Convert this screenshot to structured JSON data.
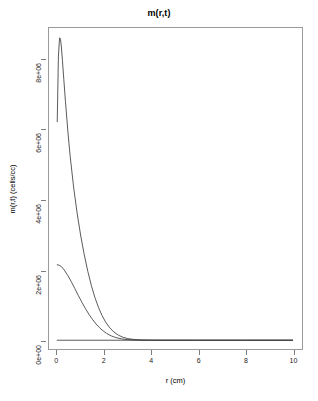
{
  "chart_data": {
    "type": "line",
    "title": "m(r,t)",
    "xlabel": "r (cm)",
    "ylabel": "m(r,t) (cells/cc)",
    "xlim": [
      -0.35,
      10.4
    ],
    "ylim": [
      -250000,
      8900000
    ],
    "grid": false,
    "legend": null,
    "x_ticks": [
      0,
      2,
      4,
      6,
      8,
      10
    ],
    "x_tick_labels": [
      "0",
      "2",
      "4",
      "6",
      "8",
      "10"
    ],
    "y_ticks": [
      0,
      2000000,
      4000000,
      6000000,
      8000000
    ],
    "y_tick_labels": [
      "0e+00",
      "2e+06",
      "4e+06",
      "6e+06",
      "8e+06"
    ],
    "line_color": "#3c3c3c",
    "axis_color": "#7d7d7d",
    "box_color": "#9a9a9a",
    "series": [
      {
        "name": "curve-peak-high",
        "color": "#3c3c3c",
        "x": [
          0.0,
          0.05,
          0.1,
          0.14,
          0.18,
          0.22,
          0.28,
          0.35,
          0.45,
          0.55,
          0.7,
          0.85,
          1.0,
          1.15,
          1.3,
          1.45,
          1.6,
          1.75,
          1.9,
          2.05,
          2.2,
          2.4,
          2.6,
          2.8,
          3.0,
          3.3,
          3.6,
          4.0,
          4.5,
          5.0,
          6.0,
          7.0,
          8.0,
          9.0,
          10.0
        ],
        "y": [
          6230000,
          8100000,
          8620000,
          8580000,
          8330000,
          7980000,
          7430000,
          6800000,
          5960000,
          5240000,
          4340000,
          3600000,
          2970000,
          2430000,
          1960000,
          1560000,
          1220000,
          940000,
          710000,
          525000,
          380000,
          238000,
          143000,
          83000,
          46000,
          18500,
          7000,
          1900,
          330,
          55,
          2,
          0,
          0,
          0,
          0
        ]
      },
      {
        "name": "curve-peak-low",
        "color": "#3c3c3c",
        "x": [
          0.0,
          0.08,
          0.18,
          0.3,
          0.45,
          0.6,
          0.75,
          0.9,
          1.05,
          1.2,
          1.35,
          1.5,
          1.65,
          1.8,
          1.95,
          2.1,
          2.3,
          2.5,
          2.75,
          3.0,
          3.3,
          3.6,
          4.0,
          4.5,
          5.0,
          6.0,
          7.0,
          8.0,
          9.0,
          10.0
        ],
        "y": [
          2150000,
          2140000,
          2095000,
          2000000,
          1845000,
          1665000,
          1470000,
          1270000,
          1080000,
          900000,
          735000,
          590000,
          462000,
          354000,
          266000,
          194000,
          122000,
          73000,
          36500,
          17000,
          6300,
          2200,
          560,
          88,
          13,
          0,
          0,
          0,
          0,
          0
        ]
      },
      {
        "name": "curve-baseline",
        "color": "#3c3c3c",
        "x": [
          0.0,
          10.0
        ],
        "y": [
          0,
          0
        ]
      }
    ]
  },
  "axis_titles": {
    "x": "r (cm)",
    "y": "m(r,t) (cells/cc)"
  },
  "header": {
    "title": "m(r,t)"
  }
}
